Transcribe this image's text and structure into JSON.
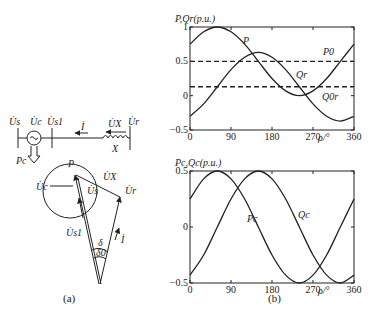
{
  "panel_a": {
    "caption": "(a)",
    "circuit": {
      "bus_labels": [
        "U̇s",
        "U̇c",
        "U̇s1",
        "U̇r"
      ],
      "current_label": "İ",
      "reactor_voltage_label": "U̇X",
      "reactance_label": "X",
      "power_label": "Pc"
    },
    "phasor": {
      "point_label": "P",
      "labels": {
        "uc": "U̇c",
        "us": "U̇s",
        "ux": "U̇X",
        "ur": "U̇r",
        "us1": "U̇s1",
        "i": "İ",
        "delta": "δ",
        "delta0": "δ0"
      }
    }
  },
  "panel_b": {
    "caption": "(b)"
  },
  "chart_data": [
    {
      "type": "line",
      "title": "",
      "ylabel": "P,Qr(p.u.)",
      "xlabel": "ρ/°",
      "x_ticks": [
        0,
        90,
        180,
        270,
        360
      ],
      "y_ticks": [
        -0.5,
        0,
        0.5,
        1
      ],
      "xlim": [
        0,
        360
      ],
      "ylim": [
        -0.5,
        1
      ],
      "grid": false,
      "x": [
        0,
        30,
        60,
        90,
        120,
        150,
        180,
        210,
        240,
        270,
        300,
        330,
        360
      ],
      "series": [
        {
          "name": "P",
          "style": "solid",
          "values": [
            0.75,
            0.93,
            1.0,
            0.93,
            0.75,
            0.5,
            0.25,
            0.07,
            0.0,
            0.07,
            0.25,
            0.5,
            0.75
          ]
        },
        {
          "name": "Qr",
          "style": "solid",
          "values": [
            -0.3,
            -0.12,
            0.13,
            0.38,
            0.56,
            0.63,
            0.56,
            0.38,
            0.13,
            -0.12,
            -0.3,
            -0.37,
            -0.3
          ]
        },
        {
          "name": "P0",
          "style": "dashed",
          "values": [
            0.5,
            0.5,
            0.5,
            0.5,
            0.5,
            0.5,
            0.5,
            0.5,
            0.5,
            0.5,
            0.5,
            0.5,
            0.5
          ]
        },
        {
          "name": "Q0r",
          "style": "dashed",
          "values": [
            0.13,
            0.13,
            0.13,
            0.13,
            0.13,
            0.13,
            0.13,
            0.13,
            0.13,
            0.13,
            0.13,
            0.13,
            0.13
          ]
        }
      ],
      "annotations": [
        "P",
        "P0",
        "Qr",
        "Q0r"
      ]
    },
    {
      "type": "line",
      "title": "",
      "ylabel": "Pc,Qc(p.u.)",
      "xlabel": "ρ/°",
      "x_ticks": [
        0,
        90,
        180,
        270,
        360
      ],
      "y_ticks": [
        -0.5,
        0,
        0.5
      ],
      "xlim": [
        0,
        360
      ],
      "ylim": [
        -0.5,
        0.5
      ],
      "grid": false,
      "x": [
        0,
        30,
        60,
        90,
        120,
        150,
        180,
        210,
        240,
        270,
        300,
        330,
        360
      ],
      "series": [
        {
          "name": "Pc",
          "style": "solid",
          "values": [
            0.25,
            0.43,
            0.5,
            0.43,
            0.25,
            0.0,
            -0.25,
            -0.43,
            -0.5,
            -0.43,
            -0.25,
            0.0,
            0.25
          ]
        },
        {
          "name": "Qc",
          "style": "solid",
          "values": [
            -0.43,
            -0.25,
            0.0,
            0.25,
            0.43,
            0.5,
            0.43,
            0.25,
            0.0,
            -0.25,
            -0.43,
            -0.5,
            -0.43
          ]
        }
      ],
      "annotations": [
        "Pc",
        "Qc"
      ]
    }
  ]
}
